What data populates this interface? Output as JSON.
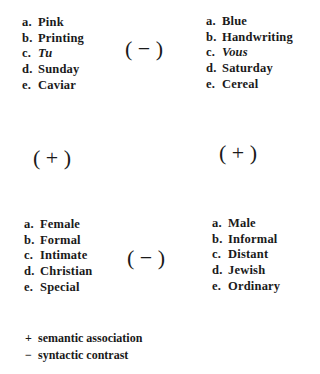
{
  "quadrants": {
    "top_left": {
      "items": [
        {
          "marker": "a.",
          "text": "Pink",
          "italic": false
        },
        {
          "marker": "b.",
          "text": "Printing",
          "italic": false
        },
        {
          "marker": "c.",
          "text": "Tu",
          "italic": true
        },
        {
          "marker": "d.",
          "text": "Sunday",
          "italic": false
        },
        {
          "marker": "e.",
          "text": "Caviar",
          "italic": false
        }
      ]
    },
    "top_right": {
      "items": [
        {
          "marker": "a.",
          "text": "Blue",
          "italic": false
        },
        {
          "marker": "b.",
          "text": "Handwriting",
          "italic": false
        },
        {
          "marker": "c.",
          "text": "Vous",
          "italic": true
        },
        {
          "marker": "d.",
          "text": "Saturday",
          "italic": false
        },
        {
          "marker": "e.",
          "text": "Cereal",
          "italic": false
        }
      ]
    },
    "bottom_left": {
      "items": [
        {
          "marker": "a.",
          "text": "Female",
          "italic": false
        },
        {
          "marker": "b.",
          "text": "Formal",
          "italic": false
        },
        {
          "marker": "c.",
          "text": "Intimate",
          "italic": false
        },
        {
          "marker": "d.",
          "text": "Christian",
          "italic": false
        },
        {
          "marker": "e.",
          "text": "Special",
          "italic": false
        }
      ]
    },
    "bottom_right": {
      "items": [
        {
          "marker": "a.",
          "text": "Male",
          "italic": false
        },
        {
          "marker": "b.",
          "text": "Informal",
          "italic": false
        },
        {
          "marker": "c.",
          "text": "Distant",
          "italic": false
        },
        {
          "marker": "d.",
          "text": "Jewish",
          "italic": false
        },
        {
          "marker": "e.",
          "text": "Ordinary",
          "italic": false
        }
      ]
    }
  },
  "relations": {
    "top_horizontal": "( − )",
    "left_vertical": "( + )",
    "right_vertical": "( + )",
    "bottom_horizontal": "( − )"
  },
  "legend": [
    {
      "symbol": "+",
      "label": "semantic association"
    },
    {
      "symbol": "−",
      "label": "syntactic contrast"
    }
  ]
}
